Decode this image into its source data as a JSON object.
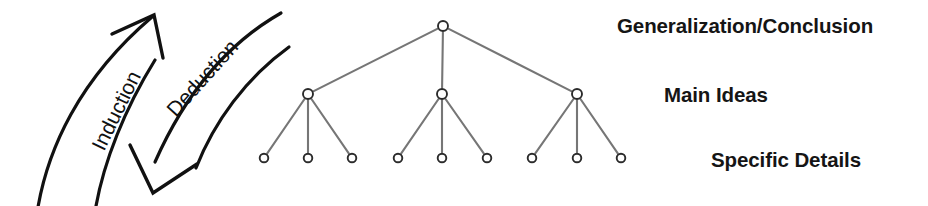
{
  "canvas": {
    "width": 928,
    "height": 206,
    "background": "#ffffff"
  },
  "figure": {
    "tier_labels": [
      {
        "id": "generalization",
        "text": "Generalization/Conclusion",
        "x": 617,
        "y": 27
      },
      {
        "id": "main_ideas",
        "text": "Main Ideas",
        "x": 664,
        "y": 95
      },
      {
        "id": "specific_details",
        "text": "Specific Details",
        "x": 711,
        "y": 160
      }
    ],
    "arrows": [
      {
        "id": "induction",
        "label": "Induction",
        "direction": "upward",
        "rotation_deg": -64,
        "label_x": 104,
        "label_y": 152,
        "color": "#111111"
      },
      {
        "id": "deduction",
        "label": "Deduction",
        "direction": "downward",
        "rotation_deg": -48,
        "label_x": 176,
        "label_y": 118,
        "color": "#111111"
      }
    ]
  },
  "chart_data": {
    "type": "tree",
    "node_color": "#ffffff",
    "node_stroke": "#2b2b2b",
    "edge_color": "#767676",
    "levels": [
      {
        "name": "Generalization/Conclusion",
        "y": 26,
        "node_radius": 5.0,
        "count": 1
      },
      {
        "name": "Main Ideas",
        "y": 94,
        "node_radius": 5.0,
        "count": 3
      },
      {
        "name": "Specific Details",
        "y": 158,
        "node_radius": 4.3,
        "count": 9
      }
    ],
    "nodes": {
      "root": [
        {
          "id": "r0",
          "x": 443,
          "y": 26
        }
      ],
      "main_ideas": [
        {
          "id": "m0",
          "x": 308,
          "y": 94
        },
        {
          "id": "m1",
          "x": 442,
          "y": 94
        },
        {
          "id": "m2",
          "x": 577,
          "y": 94
        }
      ],
      "specific_details": [
        {
          "id": "d0",
          "x": 264,
          "y": 158
        },
        {
          "id": "d1",
          "x": 308,
          "y": 158
        },
        {
          "id": "d2",
          "x": 352,
          "y": 158
        },
        {
          "id": "d3",
          "x": 398,
          "y": 158
        },
        {
          "id": "d4",
          "x": 442,
          "y": 158
        },
        {
          "id": "d5",
          "x": 487,
          "y": 158
        },
        {
          "id": "d6",
          "x": 532,
          "y": 158
        },
        {
          "id": "d7",
          "x": 577,
          "y": 158
        },
        {
          "id": "d8",
          "x": 621,
          "y": 158
        }
      ]
    },
    "edges": [
      {
        "from": "r0",
        "to": "m0"
      },
      {
        "from": "r0",
        "to": "m1"
      },
      {
        "from": "r0",
        "to": "m2"
      },
      {
        "from": "m0",
        "to": "d0"
      },
      {
        "from": "m0",
        "to": "d1"
      },
      {
        "from": "m0",
        "to": "d2"
      },
      {
        "from": "m1",
        "to": "d3"
      },
      {
        "from": "m1",
        "to": "d4"
      },
      {
        "from": "m1",
        "to": "d5"
      },
      {
        "from": "m2",
        "to": "d6"
      },
      {
        "from": "m2",
        "to": "d7"
      },
      {
        "from": "m2",
        "to": "d8"
      }
    ]
  }
}
